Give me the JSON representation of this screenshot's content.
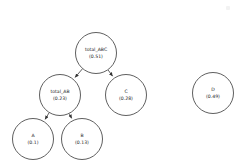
{
  "diagram": {
    "type": "directed-graph",
    "background_color": "#ffffff",
    "node_stroke_color": "#4d4d4d",
    "edge_color": "#4d4d4d",
    "text_color": "#1a1a1a",
    "nodes": [
      {
        "id": "total_ABC",
        "label": "total_ABC",
        "value": "(0.51)",
        "numeric_value": 0.51,
        "cx": 96,
        "cy": 53,
        "r": 20.5
      },
      {
        "id": "total_AB",
        "label": "total_AB",
        "value": "(0.23)",
        "numeric_value": 0.23,
        "cx": 60,
        "cy": 95,
        "r": 20.5
      },
      {
        "id": "C",
        "label": "C",
        "value": "(0.28)",
        "numeric_value": 0.28,
        "cx": 126,
        "cy": 95,
        "r": 20.5
      },
      {
        "id": "A",
        "label": "A",
        "value": "(0.1)",
        "numeric_value": 0.1,
        "cx": 33,
        "cy": 139,
        "r": 20.5
      },
      {
        "id": "B",
        "label": "B",
        "value": "(0.13)",
        "numeric_value": 0.13,
        "cx": 82,
        "cy": 139,
        "r": 20.5
      },
      {
        "id": "D",
        "label": "D",
        "value": "(0.49)",
        "numeric_value": 0.49,
        "cx": 213,
        "cy": 93,
        "r": 20.5
      }
    ],
    "edges": [
      {
        "from": "total_ABC",
        "to": "total_AB",
        "arrowhead": true
      },
      {
        "from": "total_ABC",
        "to": "C",
        "arrowhead": true
      },
      {
        "from": "total_AB",
        "to": "A",
        "arrowhead": true
      },
      {
        "from": "total_AB",
        "to": "B",
        "arrowhead": true
      }
    ]
  }
}
